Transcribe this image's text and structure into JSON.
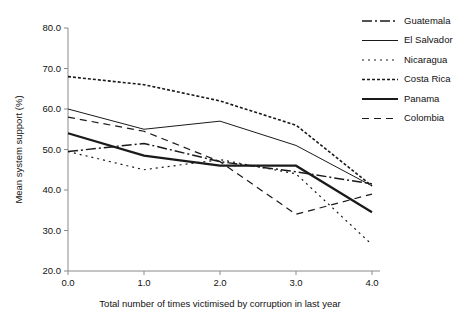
{
  "chart_data": {
    "type": "line",
    "title": "",
    "xlabel": "Total number of times victimised by corruption in last year",
    "ylabel": "Mean system support (%)",
    "x": [
      0.0,
      1.0,
      2.0,
      3.0,
      4.0
    ],
    "xticklabels": [
      "0.0",
      "1.0",
      "2.0",
      "3.0",
      "4.0"
    ],
    "yticklabels": [
      "20.0",
      "30.0",
      "40.0",
      "50.0",
      "60.0",
      "70.0",
      "80.0"
    ],
    "yticks": [
      20,
      30,
      40,
      50,
      60,
      70,
      80
    ],
    "xlim": [
      0.0,
      4.0
    ],
    "ylim": [
      20.0,
      80.0
    ],
    "grid": false,
    "legend_position": "right",
    "series": [
      {
        "name": "Guatemala",
        "values": [
          49.5,
          51.5,
          47.0,
          44.5,
          41.5
        ],
        "dash": "10,3,2,3",
        "width": 1.5
      },
      {
        "name": "El Salvador",
        "values": [
          60.0,
          55.0,
          57.0,
          51.0,
          41.0
        ],
        "dash": "none",
        "width": 1.0
      },
      {
        "name": "Nicaragua",
        "values": [
          49.5,
          45.0,
          47.5,
          44.0,
          26.5
        ],
        "dash": "2,4",
        "width": 1.2
      },
      {
        "name": "Costa Rica",
        "values": [
          68.0,
          66.0,
          62.0,
          56.0,
          41.0
        ],
        "dash": "3,2",
        "width": 1.6
      },
      {
        "name": "Panama",
        "values": [
          54.0,
          48.5,
          46.0,
          46.0,
          34.5
        ],
        "dash": "none",
        "width": 2.2
      },
      {
        "name": "Colombia",
        "values": [
          58.0,
          54.5,
          47.0,
          34.0,
          39.0
        ],
        "dash": "7,5",
        "width": 1.2
      }
    ]
  },
  "legend": {
    "items": [
      {
        "label": "Guatemala"
      },
      {
        "label": "El Salvador"
      },
      {
        "label": "Nicaragua"
      },
      {
        "label": "Costa Rica"
      },
      {
        "label": "Panama"
      },
      {
        "label": "Colombia"
      }
    ]
  }
}
